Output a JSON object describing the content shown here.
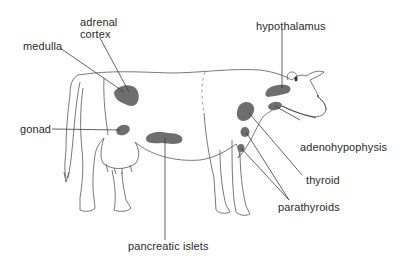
{
  "diagram": {
    "gland_color": "#6e6e6e",
    "outline_color": "#555555",
    "leader_color": "#3a3a3a",
    "labels": {
      "adrenal_cortex_line1": "adrenal",
      "adrenal_cortex_line2": "cortex",
      "medulla": "medulla",
      "gonad": "gonad",
      "hypothalamus": "hypothalamus",
      "adenohypophysis": "adenohypophysis",
      "thyroid": "thyroid",
      "parathyroids": "parathyroids",
      "pancreatic_islets": "pancreatic islets"
    }
  }
}
